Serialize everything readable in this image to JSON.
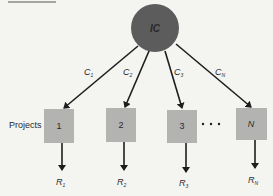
{
  "diagram": {
    "source_node": {
      "label": "IC",
      "color": "#5c5c5c"
    },
    "row_label": "Projects",
    "ellipsis": "• • •",
    "box_color": "#b3b3b1",
    "edges": [
      {
        "label": "C",
        "sub": "1"
      },
      {
        "label": "C",
        "sub": "2"
      },
      {
        "label": "C",
        "sub": "3"
      },
      {
        "label": "C",
        "sub": "N"
      }
    ],
    "projects": [
      {
        "label": "1"
      },
      {
        "label": "2"
      },
      {
        "label": "3"
      },
      {
        "label": "N"
      }
    ],
    "returns": [
      {
        "label": "R",
        "sub": "1"
      },
      {
        "label": "R",
        "sub": "2"
      },
      {
        "label": "R",
        "sub": "3"
      },
      {
        "label": "R",
        "sub": "N"
      }
    ]
  }
}
